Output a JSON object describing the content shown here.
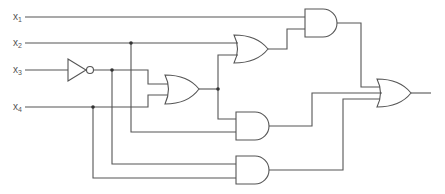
{
  "diagram": {
    "type": "logic-circuit",
    "colors": {
      "line": "#555555",
      "background": "#ffffff"
    },
    "inputs": [
      {
        "id": "x1",
        "base": "x",
        "sub": "1",
        "y": 17
      },
      {
        "id": "x2",
        "base": "x",
        "sub": "2",
        "y": 43
      },
      {
        "id": "x3",
        "base": "x",
        "sub": "3",
        "y": 70
      },
      {
        "id": "x4",
        "base": "x",
        "sub": "4",
        "y": 107
      }
    ],
    "gates": [
      {
        "id": "not1",
        "type": "NOT",
        "inputs": [
          "x3"
        ]
      },
      {
        "id": "or1",
        "type": "OR",
        "inputs": [
          "not1",
          "x4"
        ]
      },
      {
        "id": "or2",
        "type": "OR",
        "inputs": [
          "x2",
          "or1"
        ]
      },
      {
        "id": "and1",
        "type": "AND",
        "inputs": [
          "x1",
          "or2"
        ]
      },
      {
        "id": "and2",
        "type": "AND",
        "inputs": [
          "or1",
          "x2"
        ]
      },
      {
        "id": "and3",
        "type": "AND",
        "inputs": [
          "not1",
          "x4"
        ]
      },
      {
        "id": "or_out",
        "type": "OR",
        "inputs": [
          "and1",
          "and2",
          "and3"
        ]
      }
    ]
  }
}
